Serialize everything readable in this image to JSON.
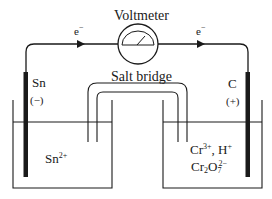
{
  "diagram": {
    "voltmeter_label": "Voltmeter",
    "electron_label": "e",
    "electron_charge": "−",
    "salt_bridge_label": "Salt bridge",
    "anode": {
      "symbol": "Sn",
      "sign": "(−)",
      "solution_ion": "Sn",
      "solution_ion_charge": "2+"
    },
    "cathode": {
      "symbol": "C",
      "sign": "(+)",
      "solution_line1_a": "Cr",
      "solution_line1_a_charge": "3+",
      "solution_line1_sep": ", H",
      "solution_line1_b_charge": "+",
      "solution_line2_a": "Cr",
      "solution_line2_sub1": "2",
      "solution_line2_b": "O",
      "solution_line2_sub2": "7",
      "solution_line2_charge": "2−"
    },
    "colors": {
      "line": "#1a1a1a",
      "electrode": "#1a1a1a",
      "background": "#ffffff"
    }
  }
}
